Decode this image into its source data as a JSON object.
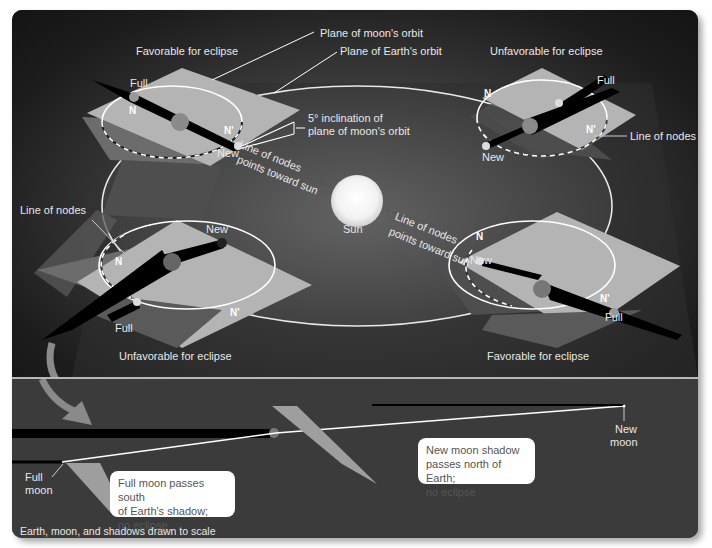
{
  "top_diagram": {
    "labels": {
      "plane_moon_orbit": "Plane of moon's orbit",
      "plane_earth_orbit": "Plane of Earth's orbit",
      "inclination_line1": "5° inclination of",
      "inclination_line2": "plane of moon's orbit",
      "sun": "Sun",
      "line_of_nodes_points_1": "Line of nodes",
      "line_of_nodes_points_2": "points toward sun"
    },
    "quadrants": [
      {
        "position": "top-left",
        "title": "Favorable for eclipse",
        "full": "Full",
        "new": "New",
        "node_n": "N",
        "node_n_prime": "N'"
      },
      {
        "position": "top-right",
        "title": "Unfavorable for eclipse",
        "full": "Full",
        "new": "New",
        "node_n": "N",
        "node_n_prime": "N'",
        "line_of_nodes": "Line of nodes"
      },
      {
        "position": "bottom-left",
        "title": "Unfavorable for eclipse",
        "full": "Full",
        "new": "New",
        "node_n": "N",
        "node_n_prime": "N'",
        "line_of_nodes": "Line of nodes"
      },
      {
        "position": "bottom-right",
        "title": "Favorable for eclipse",
        "full": "Full",
        "new": "New",
        "node_n": "N",
        "node_n_prime": "N'"
      }
    ]
  },
  "bottom_diagram": {
    "full_moon_1": "Full",
    "full_moon_2": "moon",
    "new_moon_1": "New",
    "new_moon_2": "moon",
    "full_callout": [
      "Full moon passes south",
      "of Earth's shadow;",
      "no eclipse"
    ],
    "new_callout": [
      "New moon shadow",
      "passes north of Earth;",
      "no eclipse"
    ],
    "caption": "Earth, moon, and shadows drawn to scale"
  },
  "colors": {
    "background_dark": "#1a1a1a",
    "bottom_panel": "#3b3b3b",
    "orbit_plane_light": "#b5b5b5",
    "orbit_plane_dark": "#5a5a5a",
    "sun": "#ffffff",
    "label_text": "#e8e8e8"
  }
}
